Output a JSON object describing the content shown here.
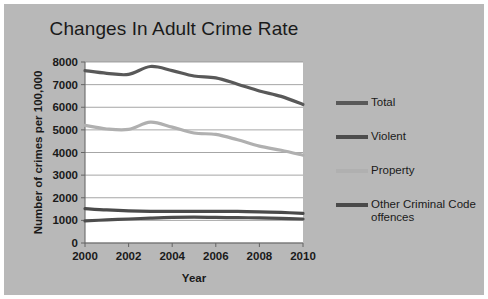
{
  "chart_data": {
    "type": "line",
    "title": "Changes In Adult Crime Rate",
    "xlabel": "Year",
    "ylabel": "Number of crimes per 100,000",
    "xlim": [
      2000,
      2010
    ],
    "ylim": [
      0,
      8000
    ],
    "grid": true,
    "legend_position": "right",
    "x": [
      2000,
      2001,
      2002,
      2003,
      2004,
      2005,
      2006,
      2007,
      2008,
      2009,
      2010
    ],
    "xticks": [
      "2000",
      "2002",
      "2004",
      "2006",
      "2008",
      "2010"
    ],
    "xtick_values": [
      2000,
      2002,
      2004,
      2006,
      2008,
      2010
    ],
    "yticks": [
      "0",
      "1000",
      "2000",
      "3000",
      "4000",
      "5000",
      "6000",
      "7000",
      "8000"
    ],
    "ytick_values": [
      0,
      1000,
      2000,
      3000,
      4000,
      5000,
      6000,
      7000,
      8000
    ],
    "series": [
      {
        "name": "Total",
        "color": "#595959",
        "values": [
          7620,
          7500,
          7450,
          7800,
          7620,
          7380,
          7300,
          7020,
          6720,
          6480,
          6120
        ]
      },
      {
        "name": "Violent",
        "color": "#4d4d4d",
        "values": [
          980,
          1020,
          1060,
          1100,
          1130,
          1140,
          1130,
          1120,
          1110,
          1090,
          1060
        ]
      },
      {
        "name": "Property",
        "color": "#b0b0b0",
        "values": [
          5200,
          5040,
          5020,
          5340,
          5120,
          4860,
          4800,
          4560,
          4280,
          4100,
          3880
        ]
      },
      {
        "name": "Other Criminal Code\noffences",
        "color": "#4a4a4a",
        "values": [
          1520,
          1460,
          1420,
          1400,
          1400,
          1400,
          1400,
          1400,
          1380,
          1350,
          1310
        ]
      }
    ]
  },
  "legend": {
    "items": [
      {
        "label": "Total",
        "color": "#595959"
      },
      {
        "label": "Violent",
        "color": "#4d4d4d"
      },
      {
        "label": "Property",
        "color": "#b0b0b0"
      },
      {
        "label": "Other Criminal Code\noffences",
        "color": "#4a4a4a"
      }
    ]
  }
}
